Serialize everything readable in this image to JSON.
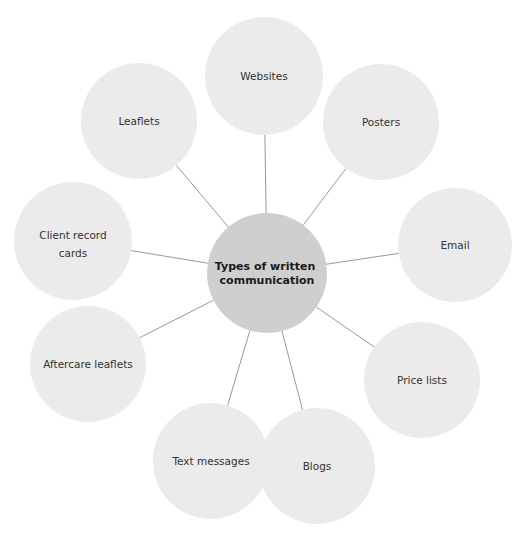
{
  "diagram": {
    "type": "mind-map",
    "colors": {
      "background": "#ffffff",
      "outer_fill": "#ebebeb",
      "center_fill": "#cfcfcf",
      "connector": "#8c8c8c",
      "outer_text": "#333333",
      "center_text": "#1a1a1a"
    },
    "center": {
      "label_lines": [
        "Types of written",
        "communication"
      ],
      "cx": 267,
      "cy": 273,
      "r": 60
    },
    "nodes": [
      {
        "id": "websites",
        "label_lines": [
          "Websites"
        ],
        "cx": 264,
        "cy": 76,
        "r": 59
      },
      {
        "id": "posters",
        "label_lines": [
          "Posters"
        ],
        "cx": 381,
        "cy": 122,
        "r": 58
      },
      {
        "id": "email",
        "label_lines": [
          "Email"
        ],
        "cx": 455,
        "cy": 245,
        "r": 57
      },
      {
        "id": "price-lists",
        "label_lines": [
          "Price lists"
        ],
        "cx": 422,
        "cy": 380,
        "r": 58
      },
      {
        "id": "blogs",
        "label_lines": [
          "Blogs"
        ],
        "cx": 317,
        "cy": 466,
        "r": 58
      },
      {
        "id": "text-messages",
        "label_lines": [
          "Text messages"
        ],
        "cx": 211,
        "cy": 461,
        "r": 58
      },
      {
        "id": "aftercare-leaflets",
        "label_lines": [
          "Aftercare leaflets"
        ],
        "cx": 88,
        "cy": 364,
        "r": 58
      },
      {
        "id": "client-record-cards",
        "label_lines": [
          "Client record",
          "cards"
        ],
        "cx": 73,
        "cy": 241,
        "r": 59
      },
      {
        "id": "leaflets",
        "label_lines": [
          "Leaflets"
        ],
        "cx": 139,
        "cy": 121,
        "r": 58
      }
    ]
  }
}
